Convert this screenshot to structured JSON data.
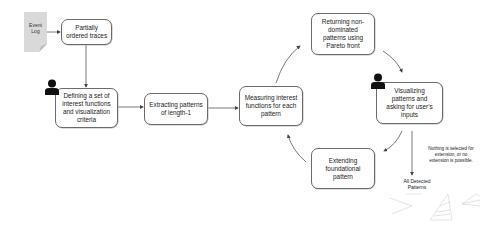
{
  "diagram": {
    "input": {
      "label": "Event\nLog",
      "icon": "document-icon"
    },
    "nodes": [
      {
        "id": "partial",
        "label": "Partially\nordered traces"
      },
      {
        "id": "define",
        "label": "Defining a set of\ninterest functions\nand visualization\ncriteria",
        "user_icon": true
      },
      {
        "id": "extract",
        "label": "Extracting patterns\nof length-1"
      },
      {
        "id": "measure",
        "label": "Measuring interest\nfunctions for each\npattern"
      },
      {
        "id": "pareto",
        "label": "Returning non-\ndominated\npatterns using\nPareto front"
      },
      {
        "id": "visualize",
        "label": "Visualizing\npatterns and\nasking for user's\ninputs",
        "user_icon": true
      },
      {
        "id": "extend",
        "label": "Extending\nfoundational\npattern"
      }
    ],
    "edges": [
      [
        "Event Log",
        "Partially ordered traces"
      ],
      [
        "Partially ordered traces",
        "Defining a set of interest functions and visualization criteria"
      ],
      [
        "Defining a set of interest functions and visualization criteria",
        "Extracting patterns of length-1"
      ],
      [
        "Extracting patterns of length-1",
        "Measuring interest functions for each pattern"
      ],
      [
        "Measuring interest functions for each pattern",
        "Returning non-dominated patterns using Pareto front"
      ],
      [
        "Returning non-dominated patterns using Pareto front",
        "Visualizing patterns and asking for user's inputs"
      ],
      [
        "Visualizing patterns and asking for user's inputs",
        "Extending foundational pattern"
      ],
      [
        "Extending foundational pattern",
        "Measuring interest functions for each pattern"
      ],
      [
        "Visualizing patterns and asking for user's inputs",
        "All Detected Patterns"
      ]
    ],
    "exit_note": "Nothing is selected for\nextension, or no\nextension is possible.",
    "output": {
      "label": "All Detected\nPatterns",
      "icon": "pattern-graphs-icon"
    }
  }
}
